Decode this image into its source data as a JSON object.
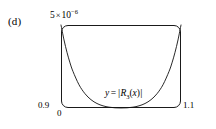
{
  "figure": {
    "panel_label": "(d)",
    "axis_annotations": {
      "y_max_mantissa": "5",
      "y_max_times": "×",
      "y_max_base": "10",
      "y_max_exponent": "−6",
      "y_min": "0.9",
      "x_min": "0",
      "x_max": "1.1"
    },
    "curve_annotation": {
      "y_symbol": "y",
      "equals": "=",
      "open_bar": "|",
      "fn_name": "R",
      "fn_index": "3",
      "arg_open": "(",
      "arg": "x",
      "arg_close": ")",
      "close_bar": "|",
      "full_text": "y = |R3(x)|"
    },
    "colors": {
      "background": "#ffffff",
      "frame": "#1a1a1a",
      "curve": "#111111",
      "text": "#000000"
    }
  },
  "chart_data": {
    "type": "line",
    "title": "",
    "subtitle": "",
    "xlabel": "",
    "ylabel": "",
    "xlim": [
      0.9,
      1.1
    ],
    "ylim": [
      0,
      5e-06
    ],
    "grid": false,
    "legend": null,
    "annotations": [
      {
        "text": "(d)",
        "position": "outside-left"
      },
      {
        "text": "5 × 10⁻⁶",
        "position": "top-left-axis-max"
      },
      {
        "text": "0.9",
        "position": "bottom-left-y-min"
      },
      {
        "text": "0",
        "position": "bottom-left-x-origin"
      },
      {
        "text": "1.1",
        "position": "bottom-right-x-max"
      },
      {
        "text": "y = |R3(x)|",
        "position": "inside-plot-center-right"
      }
    ],
    "series": [
      {
        "name": "y = |R3(x)|",
        "x": [
          0.9,
          0.905,
          0.91,
          0.915,
          0.92,
          0.93,
          0.94,
          0.95,
          0.96,
          0.97,
          0.98,
          0.99,
          1.0,
          1.01,
          1.02,
          1.03,
          1.04,
          1.05,
          1.06,
          1.07,
          1.08,
          1.085,
          1.09,
          1.095,
          1.1
        ],
        "y": [
          5e-06,
          4.1e-06,
          3.35e-06,
          2.72e-06,
          2.2e-06,
          1.4e-06,
          8.6e-07,
          5e-07,
          2.7e-07,
          1.3e-07,
          5e-08,
          1.2e-08,
          2e-09,
          1.2e-08,
          5e-08,
          1.3e-07,
          2.7e-07,
          5e-07,
          8.6e-07,
          1.4e-06,
          2.2e-06,
          2.72e-06,
          3.35e-06,
          4.1e-06,
          5e-06
        ]
      }
    ]
  }
}
